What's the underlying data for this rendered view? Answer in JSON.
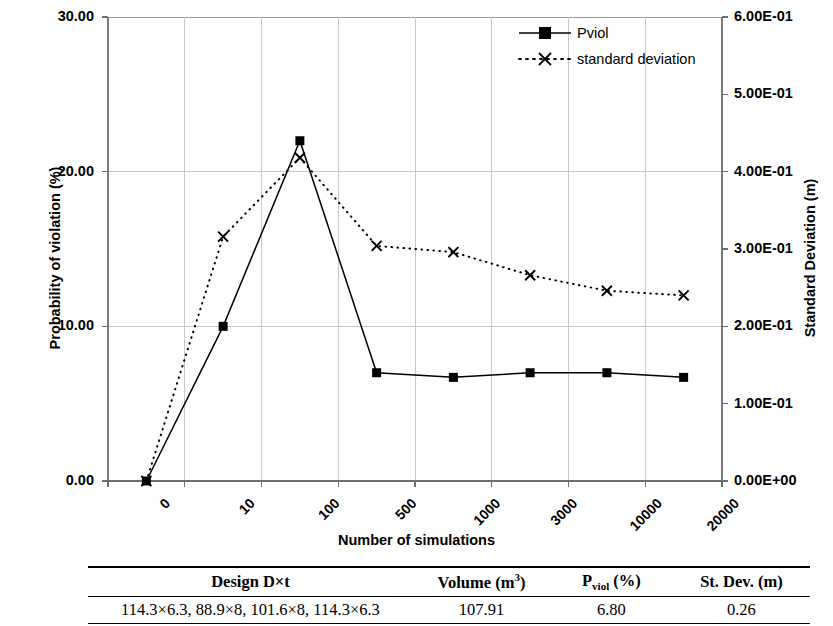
{
  "chart_data": {
    "type": "line",
    "title": "",
    "xlabel": "Number of simulations",
    "ylabel": "Probability of violation (%)",
    "y2label": "Standard Deviation (m)",
    "categories": [
      "0",
      "10",
      "100",
      "500",
      "1000",
      "3000",
      "10000",
      "20000"
    ],
    "ylim": [
      0,
      30
    ],
    "y2lim": [
      0,
      0.6
    ],
    "yticks": [
      "0.00",
      "10.00",
      "20.00",
      "30.00"
    ],
    "ytick_values": [
      0,
      10,
      20,
      30
    ],
    "y2ticks": [
      "0.00E+00",
      "1.00E-01",
      "2.00E-01",
      "3.00E-01",
      "4.00E-01",
      "5.00E-01",
      "6.00E-01"
    ],
    "y2tick_values": [
      0,
      0.1,
      0.2,
      0.3,
      0.4,
      0.5,
      0.6
    ],
    "grid": true,
    "legend_position": "top-right",
    "series": [
      {
        "name": "Pviol",
        "axis": "left",
        "marker": "square",
        "line": "solid",
        "values": [
          0.0,
          10.0,
          22.0,
          7.0,
          6.7,
          7.0,
          7.0,
          6.7
        ]
      },
      {
        "name": "standard deviation",
        "axis": "right",
        "marker": "cross",
        "line": "dotted",
        "values": [
          0.0,
          0.316,
          0.418,
          0.304,
          0.296,
          0.266,
          0.246,
          0.24
        ],
        "values_on_left_scale": [
          0.0,
          15.8,
          20.9,
          15.2,
          14.8,
          13.3,
          12.3,
          12.0
        ]
      }
    ]
  },
  "legend": {
    "items": [
      {
        "label": "Pviol"
      },
      {
        "label": "standard deviation"
      }
    ]
  },
  "table": {
    "headers": {
      "design": "Design D×t",
      "volume_prefix": "Volume (m",
      "volume_sup": "3",
      "volume_suffix": ")",
      "pviol_prefix": "P",
      "pviol_sub": "viol",
      "pviol_suffix": " (%)",
      "stdev": "St. Dev. (m)"
    },
    "rows": [
      {
        "design": "114.3×6.3, 88.9×8, 101.6×8, 114.3×6.3",
        "volume": "107.91",
        "pviol": "6.80",
        "stdev": "0.26"
      }
    ]
  },
  "colors": {
    "series": "#000000",
    "grid": "#c8c8c8",
    "axis": "#808080",
    "background": "#ffffff"
  }
}
